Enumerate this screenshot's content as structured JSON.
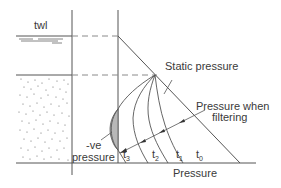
{
  "diagram": {
    "labels": {
      "twl": "twl",
      "static_pressure": "Static pressure",
      "pressure_when_line1": "Pressure when",
      "pressure_when_line2": "filtering",
      "neg_line1": "-ve",
      "neg_line2": "pressure",
      "x_axis": "Pressure"
    },
    "curves": [
      {
        "id": "t3",
        "base": "t",
        "sub": "3"
      },
      {
        "id": "t2",
        "base": "t",
        "sub": "2"
      },
      {
        "id": "t1",
        "base": "t",
        "sub": "1"
      },
      {
        "id": "t0",
        "base": "t",
        "sub": "0"
      }
    ],
    "colors": {
      "line": "#555555",
      "dash": "#8a8a8a",
      "shade": "#b8b8b8",
      "text": "#3a3a3a"
    }
  }
}
